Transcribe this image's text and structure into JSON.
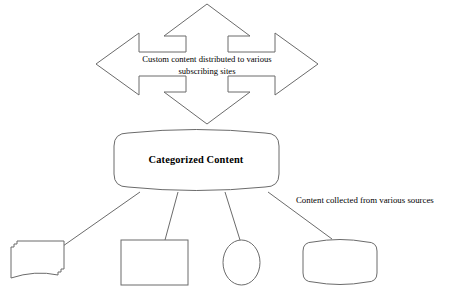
{
  "diagram": {
    "colors": {
      "stroke": "#6b6b6b",
      "fill": "#ffffff",
      "text": "#000000",
      "background": "#ffffff"
    },
    "arrow": {
      "name": "four-way-arrow",
      "caption_line1": "Custom content distributed to various",
      "caption_line2": "subscribing sites"
    },
    "cylinder": {
      "name": "categorized-content-cylinder",
      "label": "Categorized Content"
    },
    "side_label": {
      "name": "sources-caption",
      "text": "Content collected from various sources"
    },
    "sources": [
      {
        "name": "multi-document-source",
        "shape": "multi-document",
        "label": ""
      },
      {
        "name": "rectangle-source",
        "shape": "rectangle",
        "label": ""
      },
      {
        "name": "ellipse-source",
        "shape": "ellipse",
        "label": ""
      },
      {
        "name": "drum-source",
        "shape": "drum",
        "label": ""
      }
    ]
  }
}
